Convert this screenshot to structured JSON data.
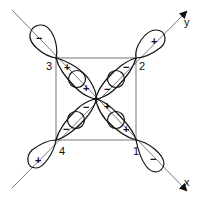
{
  "diagram": {
    "colors": {
      "stroke": "#111111",
      "thin": "#555555",
      "background": "#ffffff"
    },
    "axes": {
      "x": {
        "label": "x"
      },
      "y": {
        "label": "y"
      }
    },
    "corners": [
      {
        "id": "1",
        "label": "1",
        "outer_sign": "−",
        "inner_signs": [
          "+",
          "+"
        ]
      },
      {
        "id": "2",
        "label": "2",
        "outer_sign": "+",
        "inner_signs": [
          "−",
          "−"
        ]
      },
      {
        "id": "3",
        "label": "3",
        "outer_sign": "−",
        "inner_signs": [
          "+",
          "+"
        ]
      },
      {
        "id": "4",
        "label": "4",
        "outer_sign": "+",
        "inner_signs": [
          "−",
          "−"
        ]
      }
    ]
  }
}
